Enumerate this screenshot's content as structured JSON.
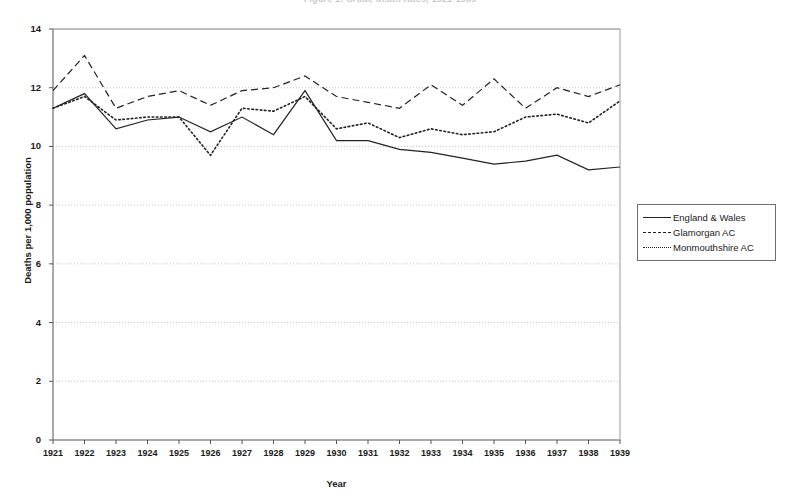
{
  "figure": {
    "title_remnant": "Figure 1: Crude death rates, 1921-1939",
    "background": "#ffffff",
    "line_color": "#222222",
    "axis_color": "#555555",
    "grid_color": "#b8b8b8"
  },
  "legend": {
    "position": "right",
    "entries": [
      {
        "label": "England & Wales",
        "style": "solid"
      },
      {
        "label": "Glamorgan AC",
        "style": "dashed"
      },
      {
        "label": "Monmouthshire AC",
        "style": "dotted"
      }
    ]
  },
  "chart_data": {
    "type": "line",
    "title": "",
    "xlabel": "Year",
    "ylabel": "Deaths per 1,000 population",
    "xlim": [
      1921,
      1939
    ],
    "ylim": [
      0,
      14
    ],
    "yticks": [
      0,
      2,
      4,
      6,
      8,
      10,
      12,
      14
    ],
    "grid": true,
    "grid_axis": "y",
    "legend_position": "right",
    "categories": [
      "1921",
      "1922",
      "1923",
      "1924",
      "1925",
      "1926",
      "1927",
      "1928",
      "1929",
      "1930",
      "1931",
      "1932",
      "1933",
      "1934",
      "1935",
      "1936",
      "1937",
      "1938",
      "1939"
    ],
    "x": [
      1921,
      1922,
      1923,
      1924,
      1925,
      1926,
      1927,
      1928,
      1929,
      1930,
      1931,
      1932,
      1933,
      1934,
      1935,
      1936,
      1937,
      1938,
      1939
    ],
    "series": [
      {
        "name": "England & Wales",
        "style": "solid",
        "values": [
          11.3,
          11.8,
          10.6,
          10.9,
          11.0,
          10.5,
          11.0,
          10.4,
          11.9,
          10.2,
          10.2,
          9.9,
          9.8,
          9.6,
          9.4,
          9.5,
          9.7,
          9.2,
          9.3
        ]
      },
      {
        "name": "Glamorgan AC",
        "style": "dashed",
        "values": [
          11.9,
          13.1,
          11.3,
          11.7,
          11.9,
          11.4,
          11.9,
          12.0,
          12.4,
          11.7,
          11.5,
          11.3,
          12.1,
          11.4,
          12.3,
          11.3,
          12.0,
          11.7,
          12.1
        ]
      },
      {
        "name": "Monmouthshire AC",
        "style": "dotted",
        "values": [
          11.3,
          11.7,
          10.9,
          11.0,
          11.0,
          9.7,
          11.3,
          11.2,
          11.7,
          10.6,
          10.8,
          10.3,
          10.6,
          10.4,
          10.5,
          11.0,
          11.1,
          10.8,
          11.55
        ]
      }
    ]
  },
  "axes": {
    "y_tick_labels": [
      "14",
      "12",
      "10",
      "8",
      "6",
      "4",
      "2",
      "0"
    ],
    "x_tick_labels": [
      "1921",
      "1922",
      "1923",
      "1924",
      "1925",
      "1926",
      "1927",
      "1928",
      "1929",
      "1930",
      "1931",
      "1932",
      "1933",
      "1934",
      "1935",
      "1936",
      "1937",
      "1938",
      "1939"
    ]
  }
}
